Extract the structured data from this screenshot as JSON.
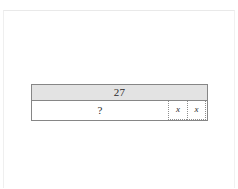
{
  "page": {
    "background_color": "#ffffff",
    "frame_color": "#ececec"
  },
  "diagram": {
    "type": "bar-model",
    "name": "tape-diagram",
    "total_row": {
      "label": "27",
      "fill_color": "#e3e3e3",
      "border_color": "#868686"
    },
    "parts_row": {
      "fill_color": "#ffffff",
      "border_color": "#868686",
      "cells": [
        {
          "label": "?",
          "kind": "unknown-part",
          "border_style": "solid"
        },
        {
          "label": "x",
          "kind": "variable-part",
          "border_style": "dotted"
        },
        {
          "label": "x",
          "kind": "variable-part",
          "border_style": "dotted"
        }
      ]
    }
  }
}
